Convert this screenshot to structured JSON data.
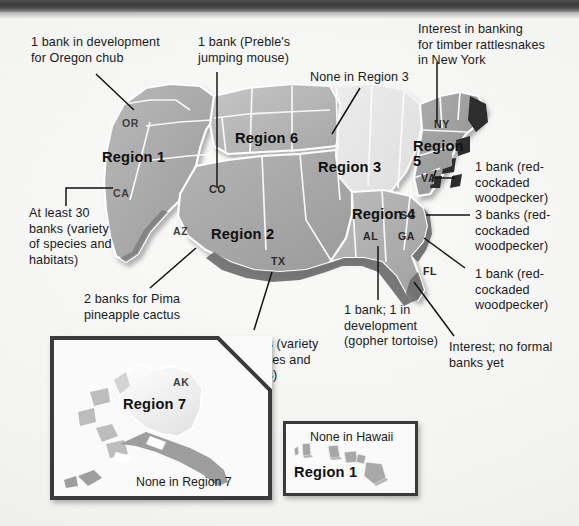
{
  "figure": {
    "kind": "us-map-infographic",
    "background_color": "#f3f3f1",
    "top_band_color": "#3f3f3f"
  },
  "annotations": [
    {
      "id": "oregon-chub",
      "text": "1 bank in development\nfor Oregon chub"
    },
    {
      "id": "prebles-mouse",
      "text": "1 bank (Preble's\njumping mouse)"
    },
    {
      "id": "none-region-3",
      "text": "None in Region 3"
    },
    {
      "id": "timber-rattlesnake",
      "text": "Interest in banking\nfor timber rattlesnakes\nin New York"
    },
    {
      "id": "at-least-30-banks",
      "text": "At least 30\nbanks (variety\nof species and\nhabitats)"
    },
    {
      "id": "rcw-1-va",
      "text": "1 bank (red-\ncockaded\nwoodpecker)"
    },
    {
      "id": "rcw-3-sc",
      "text": "3 banks (red-\ncockaded\nwoodpecker)"
    },
    {
      "id": "rcw-1-fl",
      "text": "1 bank (red-\ncockaded\nwoodpecker)"
    },
    {
      "id": "pima-cactus",
      "text": "2 banks for Pima\npineapple cactus"
    },
    {
      "id": "four-banks-tx",
      "text": "4 banks (variety\nof species and\nhabitats)"
    },
    {
      "id": "gopher-tortoise",
      "text": "1 bank; 1 in\ndevelopment\n(gopher tortoise)"
    },
    {
      "id": "no-formal-banks",
      "text": "Interest; no formal\nbanks yet"
    }
  ],
  "region_labels": [
    {
      "id": "region-1",
      "text": "Region 1"
    },
    {
      "id": "region-6",
      "text": "Region 6"
    },
    {
      "id": "region-3",
      "text": "Region 3"
    },
    {
      "id": "region-2",
      "text": "Region 2"
    },
    {
      "id": "region-4",
      "text": "Region 4"
    },
    {
      "id": "region-5",
      "text": "Region\n5"
    }
  ],
  "state_labels": [
    {
      "id": "or",
      "text": "OR"
    },
    {
      "id": "ca",
      "text": "CA"
    },
    {
      "id": "az",
      "text": "AZ"
    },
    {
      "id": "co",
      "text": "CO"
    },
    {
      "id": "tx",
      "text": "TX"
    },
    {
      "id": "al",
      "text": "AL"
    },
    {
      "id": "ga",
      "text": "GA"
    },
    {
      "id": "sc",
      "text": "SC"
    },
    {
      "id": "fl",
      "text": "FL"
    },
    {
      "id": "va",
      "text": "VA"
    },
    {
      "id": "ny",
      "text": "NY"
    }
  ],
  "insets": {
    "alaska": {
      "state_label": "AK",
      "region_label": "Region 7",
      "caption": "None in Region 7"
    },
    "hawaii": {
      "caption": "None in Hawaii",
      "region_label": "Region 1"
    }
  }
}
